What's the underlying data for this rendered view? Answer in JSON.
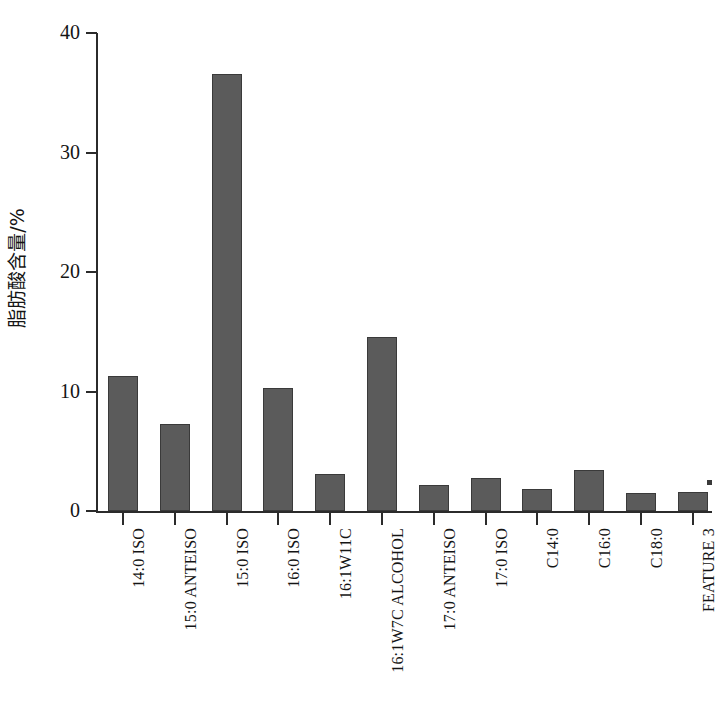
{
  "chart_data": {
    "type": "bar",
    "title": "",
    "subtitle": "",
    "xlabel": "",
    "ylabel": "脂肪酸含量/%",
    "ylim": [
      0,
      40
    ],
    "yticks": [
      0,
      10,
      20,
      30,
      40
    ],
    "ytick_labels": [
      "0",
      "10",
      "20",
      "30",
      "40"
    ],
    "grid": false,
    "legend": null,
    "bar_color": "#5b5b5b",
    "bar_edge_color": "#3a3a3a",
    "axis_color": "#2b2b2b",
    "categories": [
      "14:0 ISO",
      "15:0 ANTEISO",
      "15:0 ISO",
      "16:0 ISO",
      "16:1W11C",
      "16:1W7C ALCOHOL",
      "17:0 ANTEISO",
      "17:0 ISO",
      "C14:0",
      "C16:0",
      "C18:0",
      "FEATURE 3"
    ],
    "values": [
      11.3,
      7.3,
      36.6,
      10.3,
      3.1,
      14.6,
      2.2,
      2.8,
      1.8,
      3.4,
      1.5,
      1.6
    ]
  }
}
